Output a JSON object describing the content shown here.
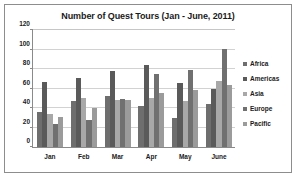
{
  "chart_data": {
    "type": "bar",
    "title": "Number of Quest Tours (Jan - June, 2011)",
    "xlabel": "",
    "ylabel": "",
    "ylim": [
      0,
      120
    ],
    "ytick_step": 20,
    "yticks": [
      "0",
      "20",
      "40",
      "60",
      "80",
      "100",
      "120"
    ],
    "grid": true,
    "grid_orientation": "horizontal",
    "legend_position": "right",
    "categories": [
      "Jan",
      "Feb",
      "Mar",
      "Apr",
      "May",
      "June"
    ],
    "series": [
      {
        "name": "Africa",
        "color": "#6e6e6e",
        "values": [
          36,
          47,
          52,
          42,
          30,
          44
        ]
      },
      {
        "name": "Americas",
        "color": "#5a5a5a",
        "values": [
          67,
          71,
          78,
          84,
          66,
          60
        ]
      },
      {
        "name": "Asia",
        "color": "#a8a8a8",
        "values": [
          34,
          50,
          48,
          50,
          47,
          68
        ]
      },
      {
        "name": "Europe",
        "color": "#707070",
        "values": [
          24,
          28,
          49,
          75,
          79,
          101
        ]
      },
      {
        "name": "Pacific",
        "color": "#9b9b9b",
        "values": [
          31,
          40,
          48,
          55,
          58,
          64
        ]
      }
    ]
  },
  "legend": {
    "items": [
      {
        "label": "Africa"
      },
      {
        "label": "Americas"
      },
      {
        "label": "Asia"
      },
      {
        "label": "Europe"
      },
      {
        "label": "Pacific"
      }
    ]
  },
  "colors": {
    "frame_border": "#8d8d8d",
    "axis": "#8a8a8a",
    "gridline": "#d2d2d2",
    "text": "#1b1b1b",
    "background": "#ffffff"
  }
}
